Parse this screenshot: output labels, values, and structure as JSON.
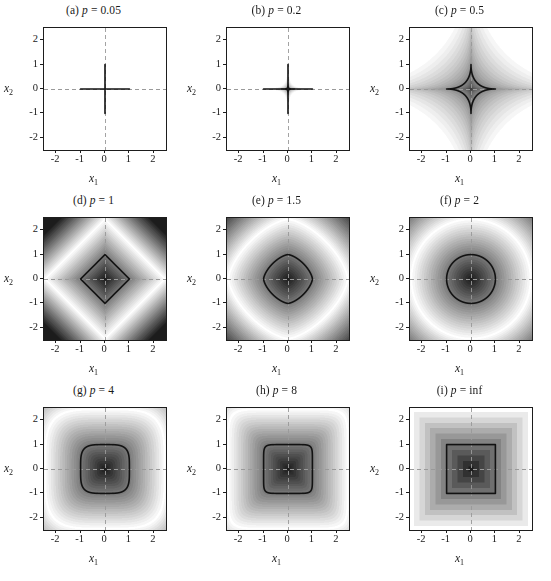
{
  "figure": {
    "title": "",
    "caption": "",
    "rows": 3,
    "cols": 3,
    "background": "#ffffff",
    "contour_color": "#121212",
    "axis_color": "#1d1d1d",
    "gridline_color": "#9a9a9a"
  },
  "axes": {
    "xlabel": "x",
    "xlabel_sub": "1",
    "ylabel": "x",
    "ylabel_sub": "2",
    "xlim": [
      -2.5,
      2.5
    ],
    "ylim": [
      -2.5,
      2.5
    ],
    "xticks": [
      "-2",
      "-1",
      "0",
      "1",
      "2"
    ],
    "xtick_values": [
      -2,
      -1,
      0,
      1,
      2
    ],
    "yticks": [
      "2",
      "1",
      "0",
      "-1",
      "-2"
    ],
    "ytick_values": [
      2,
      1,
      0,
      -1,
      -2
    ],
    "grid": true
  },
  "chart_data": {
    "type": "heatmap",
    "xlabel": "x1",
    "ylabel": "x2",
    "xlim": [
      -2.5,
      2.5
    ],
    "ylim": [
      -2.5,
      2.5
    ],
    "xticks": [
      -2,
      -1,
      0,
      1,
      2
    ],
    "yticks": [
      -2,
      -1,
      0,
      1,
      2
    ],
    "grid": true,
    "legend": "none",
    "colormap": "grayscale-banded",
    "function": "||x||_p = (|x1|^p + |x2|^p)^(1/p)",
    "contour_level": 1,
    "contour_label": "unit ball boundary ||x||_p = 1",
    "panels": [
      {
        "id": "a",
        "letter": "(a)",
        "param_symbol": "p",
        "equals": "=",
        "p_label": "0.05",
        "p_value": 0.05,
        "title": "(a) p = 0.05",
        "grid_style": "solid",
        "contour_shape": "concave-star (near-axes cross)",
        "notes": "Level sets hug the axes; unit contour nearly coincides with the x1 and x2 axes."
      },
      {
        "id": "b",
        "letter": "(b)",
        "param_symbol": "p",
        "equals": "=",
        "p_label": "0.2",
        "p_value": 0.2,
        "title": "(b) p = 0.2",
        "grid_style": "solid",
        "contour_shape": "concave-star (thin cross)",
        "notes": "Strongly concave star-shaped unit ball pressed against the axes."
      },
      {
        "id": "c",
        "letter": "(c)",
        "param_symbol": "p",
        "equals": "=",
        "p_label": "0.5",
        "p_value": 0.5,
        "title": "(c) p = 0.5",
        "grid_style": "dashed",
        "contour_shape": "astroid / concave star",
        "notes": "Visible astroid-shaped unit ball with cusps at (+/-1,0) and (0,+/-1)."
      },
      {
        "id": "d",
        "letter": "(d)",
        "param_symbol": "p",
        "equals": "=",
        "p_label": "1",
        "p_value": 1,
        "title": "(d) p = 1",
        "grid_style": "dashed",
        "contour_shape": "diamond (square rotated 45 degrees)",
        "notes": "Unit ball is the diamond with vertices at (+/-1,0) and (0,+/-1)."
      },
      {
        "id": "e",
        "letter": "(e)",
        "param_symbol": "p",
        "equals": "=",
        "p_label": "1.5",
        "p_value": 1.5,
        "title": "(e) p = 1.5",
        "grid_style": "dashed",
        "contour_shape": "rounded diamond",
        "notes": "Convex unit ball between the diamond and the circle."
      },
      {
        "id": "f",
        "letter": "(f)",
        "param_symbol": "p",
        "equals": "=",
        "p_label": "2",
        "p_value": 2,
        "title": "(f) p = 2",
        "grid_style": "dashed",
        "contour_shape": "circle",
        "notes": "Euclidean norm; unit ball is the circle of radius 1."
      },
      {
        "id": "g",
        "letter": "(g)",
        "param_symbol": "p",
        "equals": "=",
        "p_label": "4",
        "p_value": 4,
        "title": "(g) p = 4",
        "grid_style": "dashed",
        "contour_shape": "rounded square (squircle)",
        "notes": "Unit ball approaches the square as p grows."
      },
      {
        "id": "h",
        "letter": "(h)",
        "param_symbol": "p",
        "equals": "=",
        "p_label": "8",
        "p_value": 8,
        "title": "(h) p = 8",
        "grid_style": "dashed",
        "contour_shape": "square with slightly rounded corners",
        "notes": "Nearly the max-norm square."
      },
      {
        "id": "i",
        "letter": "(i)",
        "param_symbol": "p",
        "equals": "=",
        "p_label": "inf",
        "p_value": null,
        "title": "(i) p = inf",
        "grid_style": "dashed",
        "contour_shape": "square",
        "notes": "Max norm; level sets are concentric squares, unit ball is [-1,1] x [-1,1]."
      }
    ]
  }
}
